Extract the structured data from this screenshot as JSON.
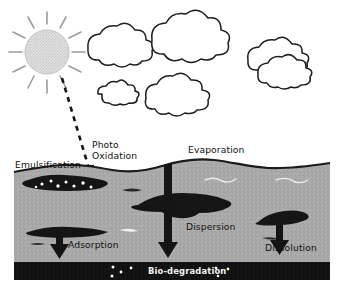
{
  "figure": {
    "background_color": "#ffffff"
  },
  "sky": {
    "sun": {
      "icon": "sun-icon",
      "fill_color": "#d9d9d9",
      "ray_color": "#9a9a9a",
      "ray_count": 12
    },
    "clouds": [
      {
        "icon": "cloud-icon",
        "outline_color": "#1a1a1a",
        "fill_color": "#ffffff"
      },
      {
        "icon": "cloud-icon",
        "outline_color": "#1a1a1a",
        "fill_color": "#ffffff"
      },
      {
        "icon": "cloud-icon",
        "outline_color": "#1a1a1a",
        "fill_color": "#ffffff"
      },
      {
        "icon": "cloud-icon",
        "outline_color": "#1a1a1a",
        "fill_color": "#ffffff"
      },
      {
        "icon": "cloud-icon",
        "outline_color": "#1a1a1a",
        "fill_color": "#ffffff"
      },
      {
        "icon": "cloud-icon",
        "outline_color": "#1a1a1a",
        "fill_color": "#ffffff"
      }
    ]
  },
  "water": {
    "fill_color": "#a9a9a9",
    "surface_line_color": "#1a1a1a"
  },
  "seabed": {
    "fill_color": "#121212",
    "label_color": "#f2f2f2"
  },
  "oil": {
    "fill_color": "#151515",
    "slick_droplet_color": "#ffffff"
  },
  "labels": {
    "emulsification": "Emulsification",
    "photo_oxidation_line1": "Photo",
    "photo_oxidation_line2": "Oxidation",
    "evaporation": "Evaporation",
    "dispersion": "Dispersion",
    "adsorption": "Adsorption",
    "dissolution": "Dissolution",
    "biodegradation": "Bio-degradation"
  },
  "arrows": {
    "evaporation_direction": "up",
    "dispersion_direction": "down",
    "adsorption_direction": "down",
    "dissolution_direction": "down",
    "photo_oxidation_style": "dashed"
  },
  "caption": {
    "cut_off_text": ""
  }
}
